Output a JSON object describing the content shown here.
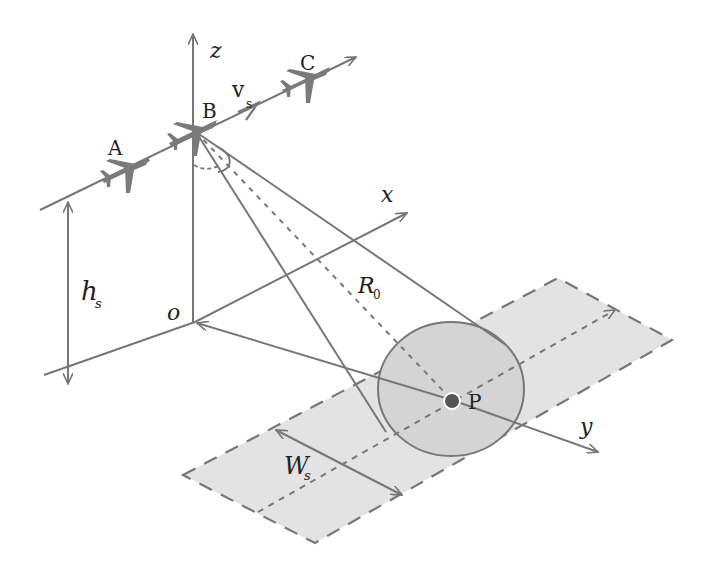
{
  "diagram": {
    "type": "SAR imaging geometry",
    "colors": {
      "line": "#777777",
      "strip_fill": "#e3e3e3",
      "footprint_fill": "#d6d6d6",
      "aircraft": "#7a7a7a",
      "point_dot": "#555555",
      "text": "#222222"
    },
    "aircraft_labels": {
      "a": "A",
      "b": "B",
      "c": "C"
    },
    "velocity": {
      "symbol": "v",
      "subscript": "s"
    },
    "axes": {
      "x": "x",
      "y": "y",
      "z": "z",
      "origin": "o"
    },
    "height": {
      "symbol": "h",
      "subscript": "s"
    },
    "range": {
      "symbol": "R",
      "subscript": "0"
    },
    "swath": {
      "symbol": "W",
      "subscript": "s"
    },
    "target": {
      "label": "P"
    }
  }
}
